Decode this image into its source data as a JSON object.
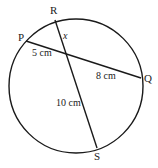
{
  "diagram": {
    "points": {
      "P": "P",
      "Q": "Q",
      "R": "R",
      "S": "S"
    },
    "labels": {
      "PX": "5 cm",
      "XQ": "8 cm",
      "XS": "10 cm",
      "RX": "x"
    },
    "stroke_color": "#1a1a1a"
  }
}
